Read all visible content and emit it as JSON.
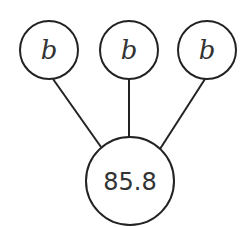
{
  "diagram": {
    "type": "tree",
    "children": [
      {
        "label": "b",
        "cx": 49,
        "cy": 50,
        "r": 29
      },
      {
        "label": "b",
        "cx": 129,
        "cy": 50,
        "r": 29
      },
      {
        "label": "b",
        "cx": 207,
        "cy": 50,
        "r": 29
      }
    ],
    "root": {
      "label": "85.8",
      "cx": 130,
      "cy": 181,
      "r": 44
    },
    "stroke_color": "#222222"
  }
}
